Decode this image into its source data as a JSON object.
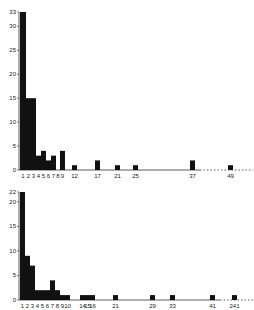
{
  "chart_data": [
    {
      "type": "bar",
      "title": "",
      "xlabel": "",
      "ylabel": "",
      "ylim": [
        0,
        33
      ],
      "yticks": [
        0,
        5,
        10,
        15,
        20,
        25,
        30,
        33
      ],
      "xtick_labels": [
        "1",
        "2",
        "3",
        "4",
        "5",
        "6",
        "7",
        "8",
        "9",
        "12",
        "17",
        "21",
        "25",
        "37",
        "49"
      ],
      "categories": [
        "1",
        "2",
        "3",
        "4",
        "5",
        "6",
        "7",
        "8",
        "9",
        "12",
        "17",
        "21",
        "25",
        "37",
        "49"
      ],
      "values": [
        33,
        15,
        15,
        3,
        4,
        2,
        3,
        0,
        4,
        1,
        2,
        1,
        1,
        2,
        1
      ],
      "grid": false,
      "note": "dotted axis break between 37 and 49"
    },
    {
      "type": "bar",
      "title": "",
      "xlabel": "",
      "ylabel": "",
      "ylim": [
        0,
        22
      ],
      "yticks": [
        0,
        5,
        10,
        15,
        20,
        22
      ],
      "xtick_labels": [
        "1",
        "2",
        "3",
        "4",
        "5",
        "6",
        "7",
        "8",
        "9",
        "10",
        "14",
        "15",
        "16",
        "21",
        "29",
        "33",
        "41",
        "241"
      ],
      "categories": [
        "1",
        "2",
        "3",
        "4",
        "5",
        "6",
        "7",
        "8",
        "9",
        "10",
        "14",
        "15",
        "16",
        "21",
        "29",
        "33",
        "41",
        "241"
      ],
      "values": [
        22,
        9,
        7,
        2,
        2,
        2,
        4,
        2,
        1,
        1,
        1,
        1,
        1,
        1,
        1,
        1,
        1,
        1
      ],
      "grid": false,
      "note": "dotted axis break between 41 and 241"
    }
  ],
  "colors": {
    "bar": "#111111",
    "axis": "#333333",
    "background": "#ffffff"
  }
}
